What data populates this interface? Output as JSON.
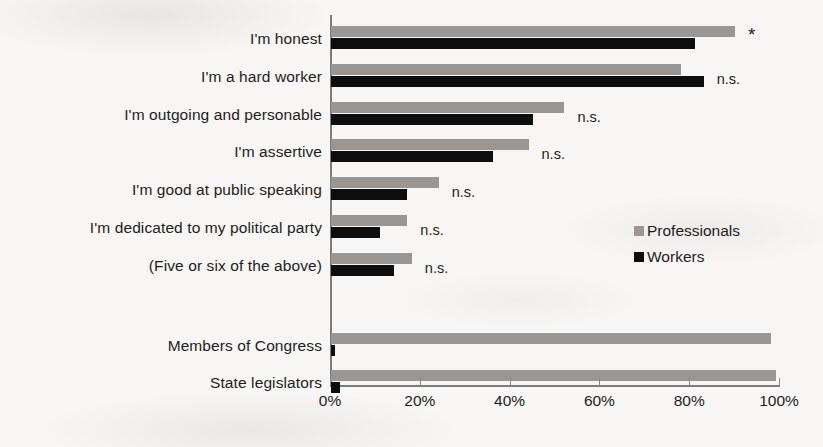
{
  "chart_data": {
    "type": "bar",
    "orientation": "horizontal",
    "title": "",
    "subtitle": "",
    "xlabel": "",
    "ylabel": "",
    "xlim": [
      0,
      100
    ],
    "xticks": [
      0,
      20,
      40,
      60,
      80,
      100
    ],
    "xtick_labels": [
      "0%",
      "20%",
      "40%",
      "60%",
      "80%",
      "100%"
    ],
    "grid": false,
    "legend_position": "middle-right",
    "categories": [
      "I'm honest",
      "I'm a hard worker",
      "I'm outgoing and personable",
      "I'm assertive",
      "I'm good at public speaking",
      "I'm dedicated to my political party",
      "(Five or six of the above)",
      "Members of Congress",
      "State legislators"
    ],
    "series": [
      {
        "name": "Professionals",
        "color": "#999693",
        "values": [
          90,
          78,
          52,
          44,
          24,
          17,
          18,
          98,
          99
        ]
      },
      {
        "name": "Workers",
        "color": "#0e0e0e",
        "values": [
          81,
          83,
          45,
          36,
          17,
          11,
          14,
          1,
          2
        ]
      }
    ],
    "annotations": [
      {
        "category": "I'm honest",
        "text": "*"
      },
      {
        "category": "I'm a hard worker",
        "text": "n.s."
      },
      {
        "category": "I'm outgoing and personable",
        "text": "n.s."
      },
      {
        "category": "I'm assertive",
        "text": "n.s."
      },
      {
        "category": "I'm good at public speaking",
        "text": "n.s."
      },
      {
        "category": "I'm dedicated to my political party",
        "text": "n.s."
      },
      {
        "category": "(Five or six of the above)",
        "text": "n.s."
      },
      {
        "category": "Members of Congress",
        "text": ""
      },
      {
        "category": "State legislators",
        "text": ""
      }
    ]
  },
  "legend": {
    "items": [
      {
        "label": "Professionals",
        "swatch": "pro"
      },
      {
        "label": "Workers",
        "swatch": "wrk"
      }
    ]
  },
  "axis": {
    "labels": [
      "0%",
      "20%",
      "40%",
      "60%",
      "80%",
      "100%"
    ]
  }
}
